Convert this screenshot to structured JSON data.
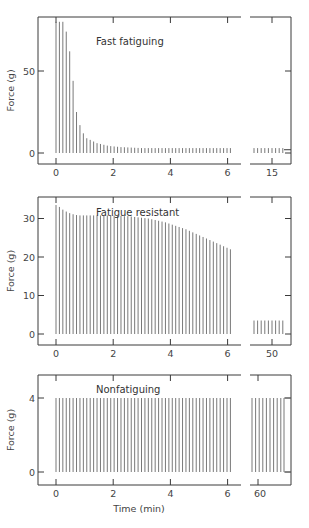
{
  "figure": {
    "xlabel": "Time (min)",
    "ylabel": "Force (g)"
  },
  "chart_data": [
    {
      "type": "bar",
      "title": "Fast fatiguing",
      "xlabel": "",
      "ylabel": "Force (g)",
      "ylim": [
        -7,
        85
      ],
      "yticks": [
        0,
        50
      ],
      "xticks_main": [
        "0",
        "2",
        "4",
        "6"
      ],
      "xtick_break": "15",
      "xlim_main": [
        -0.2,
        6.4
      ],
      "bar_interval_min": 0.12,
      "main_values": [
        80,
        80,
        80,
        74,
        62,
        44,
        25,
        17,
        12,
        9,
        8,
        7,
        6,
        5.5,
        5,
        4.5,
        4.2,
        4,
        3.8,
        3.6,
        3.5,
        3.4,
        3.3,
        3.2,
        3.1,
        3,
        3,
        3,
        3,
        3,
        3,
        3,
        3,
        3,
        3,
        3,
        3,
        3,
        3,
        3,
        3,
        3,
        3,
        3,
        3,
        3,
        3,
        3,
        3,
        3,
        3,
        3
      ],
      "break_values": [
        3,
        3,
        3,
        3,
        3,
        3,
        3,
        3,
        3
      ]
    },
    {
      "type": "bar",
      "title": "Fatigue resistant",
      "xlabel": "",
      "ylabel": "Force (g)",
      "ylim": [
        -3,
        35.5
      ],
      "yticks": [
        0,
        10,
        20,
        30
      ],
      "xticks_main": [
        "0",
        "2",
        "4",
        "6"
      ],
      "xtick_break": "50",
      "xlim_main": [
        -0.2,
        6.4
      ],
      "bar_interval_min": 0.12,
      "main_values": [
        33.5,
        33,
        32.3,
        31.8,
        31.4,
        31.1,
        30.9,
        30.8,
        30.8,
        30.8,
        30.8,
        30.8,
        30.8,
        30.8,
        30.8,
        30.8,
        30.8,
        30.8,
        30.7,
        30.7,
        30.6,
        30.6,
        30.5,
        30.4,
        30.3,
        30.2,
        30.1,
        30,
        29.8,
        29.6,
        29.4,
        29.2,
        29,
        28.7,
        28.4,
        28.1,
        27.8,
        27.5,
        27.2,
        26.8,
        26.4,
        26,
        25.6,
        25.2,
        24.8,
        24.4,
        24,
        23.6,
        23.2,
        22.8,
        22.4,
        22
      ],
      "break_values": [
        3.5,
        3.5,
        3.5,
        3.5,
        3.5,
        3.5,
        3.5,
        3.5,
        3.5
      ]
    },
    {
      "type": "bar",
      "title": "Nonfatiguing",
      "xlabel": "Time (min)",
      "ylabel": "Force (g)",
      "ylim": [
        -0.6,
        4.75
      ],
      "yticks": [
        0,
        4
      ],
      "xticks_main": [
        "0",
        "2",
        "4",
        "6"
      ],
      "xtick_break": "60",
      "xlim_main": [
        -0.2,
        6.4
      ],
      "bar_interval_min": 0.12,
      "main_values": [
        4,
        4,
        4,
        4,
        4,
        4,
        4,
        4,
        4,
        4,
        4,
        4,
        4,
        4,
        4,
        4,
        4,
        4,
        4,
        4,
        4,
        4,
        4,
        4,
        4,
        4,
        4,
        4,
        4,
        4,
        4,
        4,
        4,
        4,
        4,
        4,
        4,
        4,
        4,
        4,
        4,
        4,
        4,
        4,
        4,
        4,
        4,
        4,
        4,
        4,
        4,
        4
      ],
      "break_values": [
        4,
        4,
        4,
        4,
        4,
        4,
        4,
        4,
        4
      ]
    }
  ],
  "colors": {
    "axis": "#3a3a3a",
    "bar": "#6a6a6a",
    "text": "#444444"
  }
}
